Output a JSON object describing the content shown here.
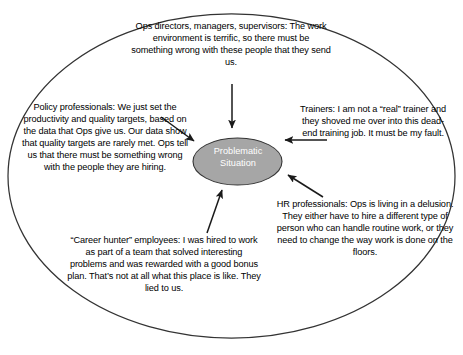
{
  "diagram": {
    "type": "central-problem-with-stakeholder-perspectives",
    "outer_boundary": {
      "shape": "ellipse",
      "stroke_color": "#333333",
      "fill_color": "#ffffff"
    },
    "center_node": {
      "label_line_1": "Problematic",
      "label_line_2": "Situation",
      "fill_color": "#a6a6a6",
      "stroke_color": "#333333",
      "text_color": "#ffffff"
    },
    "notes": {
      "ops": "Ops directors, managers, supervisors: The work environment is terrific, so there must be something wrong with these people that they send us.",
      "policy": "Policy professionals: We just set the productivity and quality targets, based on the data that Ops give us. Our data show that quality targets are rarely met. Ops tell us that there must be something wrong with the people they are hiring.",
      "trainers": "Trainers: I am not a “real” trainer and they shoved me over into this dead-end training job. It must be my fault.",
      "hr": "HR professionals: Ops is living in a delusion. They either have to hire a different type of person who can handle routine work, or they need to change the way work is done on the floors.",
      "career_hunter": "“Career hunter” employees: I was hired to work as part of a team that solved interesting problems and was rewarded with a good bonus plan. That’s not at all what this place is like. They lied to us."
    },
    "arrows": {
      "count": 5,
      "color": "#1a1a1a",
      "from_ops": "down",
      "from_policy": "down-right",
      "from_trainers": "left",
      "from_hr": "up-left",
      "from_career_hunter": "up-right"
    }
  }
}
